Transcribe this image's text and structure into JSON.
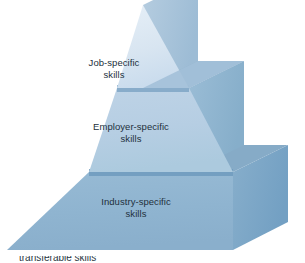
{
  "figure": {
    "type": "pyramid-diagram",
    "background_color": "#ffffff",
    "text_color": "#22303c"
  },
  "pyramid": {
    "apex": {
      "x": 143,
      "y": 5
    },
    "base_left": {
      "x": 7,
      "y": 250
    },
    "base_right_front": {
      "x": 233,
      "y": 250
    },
    "base_right_back": {
      "x": 288,
      "y": 222
    },
    "tier_divider_y": [
      88,
      172
    ],
    "tiers": [
      {
        "index": 1,
        "position": "top",
        "line1": "Job-specific",
        "line2": "skills",
        "front_color": "#dbe7f2",
        "side_color": "#a8c4da",
        "ledge_color": "#8fafc9"
      },
      {
        "index": 2,
        "position": "middle",
        "line1": "Employer-specific",
        "line2": "skills",
        "front_color": "#b7cfe3",
        "side_color": "#8fb3cf",
        "ledge_color": "#7ba0be"
      },
      {
        "index": 3,
        "position": "bottom",
        "line1": "Industry-specific",
        "line2": "skills",
        "front_color": "#8fb4d0",
        "side_color": "#79a5c6",
        "ledge_color": "#6e98bb"
      }
    ]
  },
  "caption": {
    "text": "transferable skills"
  }
}
